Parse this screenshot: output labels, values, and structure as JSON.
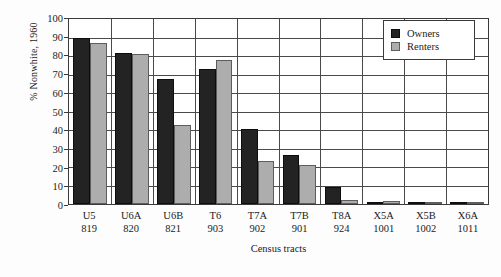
{
  "chart_data": {
    "type": "bar",
    "title": "",
    "xlabel": "Census tracts",
    "ylabel": "% Nonwhite, 1960",
    "ylim": [
      0,
      100
    ],
    "ytick_step": 10,
    "yticks": [
      100,
      90,
      80,
      70,
      60,
      50,
      40,
      30,
      20,
      10,
      0
    ],
    "grid": "horizontal-and-vertical",
    "legend_position": "top-right",
    "categories": [
      "U5",
      "U6A",
      "U6B",
      "T6",
      "T7A",
      "T7B",
      "T8A",
      "X5A",
      "X5B",
      "X6A"
    ],
    "category_numbers": [
      "819",
      "820",
      "821",
      "903",
      "902",
      "901",
      "924",
      "1001",
      "1002",
      "1011"
    ],
    "series": [
      {
        "name": "Owners",
        "color": "#232323",
        "values": [
          89,
          81,
          67,
          72,
          40,
          26,
          9,
          1,
          0.5,
          0.5
        ]
      },
      {
        "name": "Renters",
        "color": "#adadad",
        "values": [
          86,
          80,
          42,
          77,
          23,
          21,
          2,
          1.5,
          0.5,
          0.5
        ]
      }
    ]
  },
  "legend": {
    "items": [
      {
        "label": "Owners"
      },
      {
        "label": "Renters"
      }
    ]
  }
}
